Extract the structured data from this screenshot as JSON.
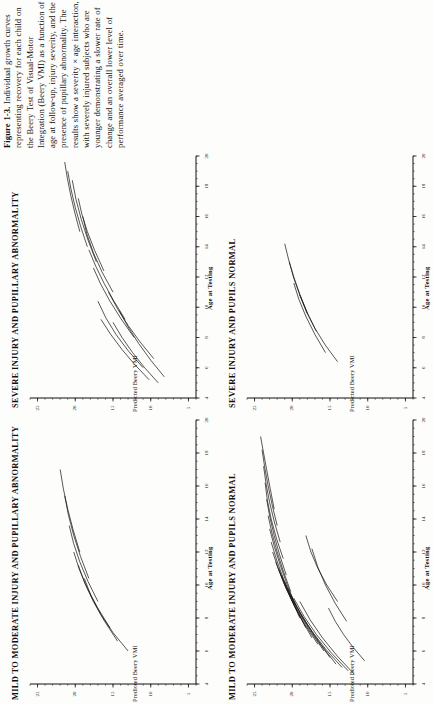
{
  "figure": {
    "label": "Figure 1-3.",
    "caption": "Individual growth curves representing recovery for each child on the Beery Test of Visual-Motor Integration (Beery VMI) as a function of age at follow-up, injury severity, and the presence of pupillary abnormality. The results show a severity × age interaction, with severely injured subjects who are younger demonstrating a slower rate of change and an overall lower level of performance averaged over time.",
    "orientation": "rotated-90-ccw"
  },
  "axes": {
    "x_label": "Age at Testing",
    "y_label": "Predicted Beery VMI",
    "x_ticks": [
      "4",
      "6",
      "8",
      "10",
      "12",
      "14",
      "16",
      "18",
      "20"
    ],
    "y_ticks": [
      "5",
      "10",
      "15",
      "20",
      "25"
    ],
    "x_range": [
      4,
      20
    ],
    "y_range": [
      4,
      26
    ]
  },
  "panels": [
    {
      "id": "severe-pupillary-abnormality",
      "title": "SEVERE INJURY AND PUPILLARY ABNORMALITY"
    },
    {
      "id": "severe-pupils-normal",
      "title": "SEVERE INJURY AND PUPILS NORMAL"
    },
    {
      "id": "mild-moderate-pupillary-abnormality",
      "title": "MILD TO MODERATE INJURY AND PUPILLARY ABNORMALITY"
    },
    {
      "id": "mild-moderate-pupils-normal",
      "title": "MILD TO MODERATE INJURY AND PUPILS NORMAL"
    }
  ],
  "chart_data": [
    {
      "type": "line",
      "panel": "severe-pupillary-abnormality",
      "title": "SEVERE INJURY AND PUPILLARY ABNORMALITY",
      "xlabel": "Age at Testing",
      "ylabel": "Predicted Beery VMI",
      "xlim": [
        4,
        20
      ],
      "ylim": [
        4,
        26
      ],
      "xticks": [
        4,
        6,
        8,
        10,
        12,
        14,
        16,
        18,
        20
      ],
      "yticks": [
        5,
        10,
        15,
        20,
        25
      ],
      "grid": false,
      "legend": null,
      "series": [
        {
          "name": "s1",
          "x": [
            5.0,
            7.0,
            9.0
          ],
          "y": [
            9.0,
            12.4,
            15.0
          ]
        },
        {
          "name": "s2",
          "x": [
            5.2,
            7.2,
            9.2
          ],
          "y": [
            10.2,
            13.8,
            16.6
          ]
        },
        {
          "name": "s3",
          "x": [
            5.4,
            7.6,
            9.8
          ],
          "y": [
            8.2,
            11.6,
            14.2
          ]
        },
        {
          "name": "s4",
          "x": [
            6.0,
            8.2,
            10.4
          ],
          "y": [
            11.0,
            14.6,
            17.0
          ]
        },
        {
          "name": "s5",
          "x": [
            6.6,
            8.8,
            11.0
          ],
          "y": [
            9.6,
            13.0,
            15.6
          ]
        },
        {
          "name": "s6",
          "x": [
            8.0,
            10.4,
            12.6
          ],
          "y": [
            12.2,
            15.4,
            17.6
          ]
        },
        {
          "name": "s7",
          "x": [
            9.2,
            11.6,
            13.8
          ],
          "y": [
            13.4,
            16.2,
            18.2
          ]
        },
        {
          "name": "s8",
          "x": [
            11.0,
            13.6,
            16.0
          ],
          "y": [
            15.0,
            17.6,
            19.0
          ]
        },
        {
          "name": "s9",
          "x": [
            12.4,
            15.0,
            17.2
          ],
          "y": [
            16.2,
            18.4,
            19.6
          ]
        },
        {
          "name": "s10",
          "x": [
            13.0,
            15.8,
            18.4
          ],
          "y": [
            17.2,
            19.2,
            20.4
          ]
        },
        {
          "name": "s11",
          "x": [
            14.0,
            16.6,
            19.0
          ],
          "y": [
            18.4,
            20.0,
            21.0
          ]
        },
        {
          "name": "s12",
          "x": [
            15.0,
            17.4,
            19.6
          ],
          "y": [
            19.4,
            20.6,
            21.4
          ]
        }
      ]
    },
    {
      "type": "line",
      "panel": "severe-pupils-normal",
      "title": "SEVERE INJURY AND PUPILS NORMAL",
      "xlabel": "Age at Testing",
      "ylabel": "Predicted Beery VMI",
      "xlim": [
        4,
        20
      ],
      "ylim": [
        4,
        26
      ],
      "xticks": [
        4,
        6,
        8,
        10,
        12,
        14,
        16,
        18,
        20
      ],
      "yticks": [
        5,
        10,
        15,
        20,
        25
      ],
      "grid": false,
      "legend": null,
      "series": [
        {
          "name": "s1",
          "x": [
            6.4,
            8.6,
            10.8
          ],
          "y": [
            14.0,
            17.0,
            19.0
          ]
        },
        {
          "name": "s2",
          "x": [
            7.0,
            9.4,
            11.6
          ],
          "y": [
            15.6,
            18.2,
            19.8
          ]
        },
        {
          "name": "s3",
          "x": [
            8.4,
            10.8,
            13.0
          ],
          "y": [
            16.8,
            19.0,
            20.4
          ]
        },
        {
          "name": "s4",
          "x": [
            9.6,
            12.0,
            14.2
          ],
          "y": [
            18.0,
            19.8,
            21.0
          ]
        }
      ]
    },
    {
      "type": "line",
      "panel": "mild-moderate-pupillary-abnormality",
      "title": "MILD TO MODERATE INJURY AND PUPILLARY ABNORMALITY",
      "xlabel": "Age at Testing",
      "ylabel": "Predicted Beery VMI",
      "xlim": [
        4,
        20
      ],
      "ylim": [
        4,
        26
      ],
      "xticks": [
        4,
        6,
        8,
        10,
        12,
        14,
        16,
        18,
        20
      ],
      "yticks": [
        5,
        10,
        15,
        20,
        25
      ],
      "grid": false,
      "legend": null,
      "series": [
        {
          "name": "s1",
          "x": [
            6.0,
            8.2,
            10.4
          ],
          "y": [
            13.0,
            16.6,
            18.8
          ]
        },
        {
          "name": "s2",
          "x": [
            6.6,
            9.0,
            11.2
          ],
          "y": [
            14.4,
            17.6,
            19.6
          ]
        },
        {
          "name": "s3",
          "x": [
            7.4,
            9.8,
            12.0
          ],
          "y": [
            15.4,
            18.4,
            20.2
          ]
        },
        {
          "name": "s4",
          "x": [
            9.0,
            11.4,
            13.6
          ],
          "y": [
            17.0,
            19.4,
            20.8
          ]
        },
        {
          "name": "s5",
          "x": [
            10.4,
            13.0,
            15.4
          ],
          "y": [
            18.2,
            20.2,
            21.4
          ]
        },
        {
          "name": "s6",
          "x": [
            12.0,
            14.6,
            17.0
          ],
          "y": [
            19.4,
            21.0,
            22.0
          ]
        }
      ]
    },
    {
      "type": "line",
      "panel": "mild-moderate-pupils-normal",
      "title": "MILD TO MODERATE INJURY AND PUPILS NORMAL",
      "xlabel": "Age at Testing",
      "ylabel": "Predicted Beery VMI",
      "xlim": [
        4,
        20
      ],
      "ylim": [
        4,
        26
      ],
      "xticks": [
        4,
        6,
        8,
        10,
        12,
        14,
        16,
        18,
        20
      ],
      "yticks": [
        5,
        10,
        15,
        20,
        25
      ],
      "grid": false,
      "legend": null,
      "series": [
        {
          "name": "s1",
          "x": [
            4.6,
            6.8,
            9.0
          ],
          "y": [
            11.8,
            16.0,
            19.0
          ]
        },
        {
          "name": "s2",
          "x": [
            4.8,
            7.0,
            9.2
          ],
          "y": [
            12.6,
            16.8,
            19.8
          ]
        },
        {
          "name": "s3",
          "x": [
            5.0,
            7.2,
            9.4
          ],
          "y": [
            13.4,
            17.4,
            20.2
          ]
        },
        {
          "name": "s4",
          "x": [
            5.2,
            7.6,
            9.8
          ],
          "y": [
            14.2,
            18.0,
            20.6
          ]
        },
        {
          "name": "s5",
          "x": [
            5.6,
            8.0,
            10.2
          ],
          "y": [
            15.0,
            18.6,
            21.0
          ]
        },
        {
          "name": "s6",
          "x": [
            6.0,
            8.4,
            10.6
          ],
          "y": [
            15.8,
            19.2,
            21.4
          ]
        },
        {
          "name": "s7",
          "x": [
            6.4,
            8.8,
            11.0
          ],
          "y": [
            16.6,
            19.8,
            21.8
          ]
        },
        {
          "name": "s8",
          "x": [
            6.8,
            9.2,
            11.4
          ],
          "y": [
            17.4,
            20.2,
            22.2
          ]
        },
        {
          "name": "s9",
          "x": [
            7.4,
            9.8,
            12.0
          ],
          "y": [
            18.2,
            20.8,
            22.6
          ]
        },
        {
          "name": "s10",
          "x": [
            8.0,
            10.4,
            12.6
          ],
          "y": [
            19.0,
            21.2,
            22.8
          ]
        },
        {
          "name": "s11",
          "x": [
            8.8,
            11.2,
            13.4
          ],
          "y": [
            19.6,
            21.6,
            23.0
          ]
        },
        {
          "name": "s12",
          "x": [
            9.6,
            12.0,
            14.2
          ],
          "y": [
            20.2,
            22.0,
            23.2
          ]
        },
        {
          "name": "s13",
          "x": [
            10.6,
            13.0,
            15.2
          ],
          "y": [
            20.8,
            22.4,
            23.4
          ]
        },
        {
          "name": "s14",
          "x": [
            11.6,
            14.0,
            16.2
          ],
          "y": [
            21.2,
            22.8,
            23.6
          ]
        },
        {
          "name": "s15",
          "x": [
            12.6,
            15.0,
            17.2
          ],
          "y": [
            21.6,
            23.0,
            23.8
          ]
        },
        {
          "name": "s16",
          "x": [
            13.6,
            16.0,
            18.2
          ],
          "y": [
            22.0,
            23.2,
            24.0
          ]
        },
        {
          "name": "s17",
          "x": [
            14.6,
            17.0,
            19.0
          ],
          "y": [
            22.4,
            23.4,
            24.2
          ]
        },
        {
          "name": "s18",
          "x": [
            5.4,
            7.0,
            8.6
          ],
          "y": [
            10.4,
            13.2,
            15.2
          ]
        },
        {
          "name": "s19",
          "x": [
            9.0,
            11.0,
            13.0
          ],
          "y": [
            14.0,
            16.6,
            18.2
          ]
        },
        {
          "name": "s20",
          "x": [
            7.8,
            10.0,
            12.2
          ],
          "y": [
            12.8,
            15.6,
            17.4
          ]
        }
      ]
    }
  ]
}
